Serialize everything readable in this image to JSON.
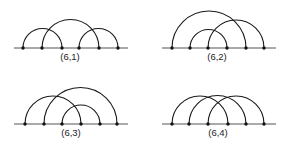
{
  "panels": [
    {
      "label": "(6,1)",
      "baseline": {
        "x1": 14,
        "x2": 128,
        "y": 48
      },
      "points": [
        23,
        42,
        62,
        79,
        99,
        118
      ],
      "arcs": [
        [
          0,
          2
        ],
        [
          1,
          4
        ],
        [
          3,
          5
        ]
      ],
      "label_pos": {
        "x": 70,
        "y": 60
      }
    },
    {
      "label": "(6,2)",
      "baseline": {
        "x1": 162,
        "x2": 276,
        "y": 48
      },
      "points": [
        172,
        190,
        208,
        227,
        246,
        264
      ],
      "arcs": [
        [
          0,
          4
        ],
        [
          1,
          3
        ],
        [
          2,
          5
        ]
      ],
      "label_pos": {
        "x": 217,
        "y": 60
      }
    },
    {
      "label": "(6,3)",
      "baseline": {
        "x1": 14,
        "x2": 128,
        "y": 124
      },
      "points": [
        25,
        44,
        62,
        81,
        100,
        117
      ],
      "arcs": [
        [
          0,
          3
        ],
        [
          1,
          5
        ],
        [
          2,
          4
        ]
      ],
      "label_pos": {
        "x": 71,
        "y": 136
      }
    },
    {
      "label": "(6,4)",
      "baseline": {
        "x1": 162,
        "x2": 276,
        "y": 124
      },
      "points": [
        172,
        189,
        208,
        228,
        246,
        264
      ],
      "arcs": [
        [
          0,
          3
        ],
        [
          1,
          4
        ],
        [
          2,
          5
        ]
      ],
      "label_pos": {
        "x": 218,
        "y": 136
      }
    }
  ]
}
